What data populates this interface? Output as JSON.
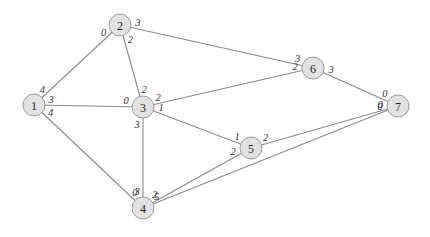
{
  "graph": {
    "type": "undirected-weighted-graph",
    "nodes": [
      {
        "id": "1",
        "label": "1"
      },
      {
        "id": "2",
        "label": "2"
      },
      {
        "id": "3",
        "label": "3"
      },
      {
        "id": "4",
        "label": "4"
      },
      {
        "id": "5",
        "label": "5"
      },
      {
        "id": "6",
        "label": "6"
      },
      {
        "id": "7",
        "label": "7"
      }
    ],
    "edges": [
      {
        "from": "1",
        "to": "2",
        "from_label": "4",
        "to_label": "0"
      },
      {
        "from": "1",
        "to": "3",
        "from_label": "3",
        "to_label": "0"
      },
      {
        "from": "1",
        "to": "4",
        "from_label": "4",
        "to_label": "0"
      },
      {
        "from": "2",
        "to": "3",
        "from_label": "2",
        "to_label": "2"
      },
      {
        "from": "2",
        "to": "6",
        "from_label": "3",
        "to_label": "3"
      },
      {
        "from": "3",
        "to": "6",
        "from_label": "2",
        "to_label": "2"
      },
      {
        "from": "3",
        "to": "5",
        "from_label": "1",
        "to_label": "1"
      },
      {
        "from": "3",
        "to": "4",
        "from_label": "3",
        "to_label": "3"
      },
      {
        "from": "4",
        "to": "5",
        "from_label": "2",
        "to_label": "2"
      },
      {
        "from": "5",
        "to": "7",
        "from_label": "2",
        "to_label": "0"
      },
      {
        "from": "4",
        "to": "7",
        "from_label": "5",
        "to_label": "0"
      },
      {
        "from": "6",
        "to": "7",
        "from_label": "3",
        "to_label": "0"
      }
    ]
  }
}
